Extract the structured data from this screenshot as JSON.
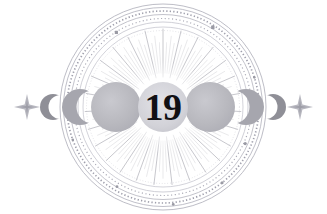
{
  "artwork": {
    "title": "Celestial Moon Phase Emblem",
    "type": "decorative-illustration",
    "canvas": {
      "width": 327,
      "height": 214,
      "background": "#ffffff"
    },
    "center_label": "19",
    "center_label_role": "day-number",
    "style": "vintage engraved astronomy / lunar calendar medallion"
  },
  "palette": {
    "background": "#ffffff",
    "ink_dark": "#111014",
    "moon_fill": "#b6b6bc",
    "moon_fill_light": "#c4c4ca",
    "crescent_fill": "#8f8f97",
    "ring_line": "#a8a8b2",
    "ring_line_faint": "#c6c6ce",
    "ray_line": "#b0b0b8",
    "marker_dot": "#9a9aa4",
    "sparkle": "#b9b9c1",
    "center_disc": "#d6d6dc"
  },
  "composition": {
    "center_x": 163,
    "center_y": 107,
    "outer_radius": 103,
    "ray_inner_radius": 30,
    "ray_outer_radius": 78,
    "ray_count": 108
  },
  "rings": [
    {
      "name": "outer-ring-1",
      "rx": 103,
      "ry": 103,
      "stroke": "#b6b6c0",
      "width": 0.9,
      "dash": "none"
    },
    {
      "name": "outer-ring-2",
      "rx": 99.5,
      "ry": 99.5,
      "stroke": "#b0b0bb",
      "width": 0.8,
      "dash": "none"
    },
    {
      "name": "tick-ring-outer",
      "rx": 96,
      "ry": 96,
      "stroke": "#a4a4b0",
      "width": 1.6,
      "dash": "1.4 2.2"
    },
    {
      "name": "outer-ring-3",
      "rx": 92.5,
      "ry": 92.5,
      "stroke": "#b4b4be",
      "width": 0.8,
      "dash": "none"
    },
    {
      "name": "tick-ring-mid",
      "rx": 88.5,
      "ry": 88.5,
      "stroke": "#aaaab6",
      "width": 1.2,
      "dash": "1.2 2.6"
    },
    {
      "name": "outer-ring-4",
      "rx": 85,
      "ry": 85,
      "stroke": "#bcbcc6",
      "width": 0.7,
      "dash": "none"
    },
    {
      "name": "inner-ring-1",
      "rx": 80,
      "ry": 80,
      "stroke": "#c0c0ca",
      "width": 0.7,
      "dash": "none"
    },
    {
      "name": "inner-ring-2",
      "rx": 76.5,
      "ry": 76.5,
      "stroke": "#c6c6ce",
      "width": 0.6,
      "dash": "0.8 2.0"
    }
  ],
  "ring_markers": [
    {
      "name": "marker-dot-ne",
      "angle_deg": -58,
      "radius": 94,
      "size": 3.4,
      "shape": "square"
    },
    {
      "name": "marker-dot-nw",
      "angle_deg": -122,
      "radius": 88,
      "size": 3.2,
      "shape": "square"
    },
    {
      "name": "marker-dot-e-upper",
      "angle_deg": -18,
      "radius": 96,
      "size": 2.6,
      "shape": "circle"
    },
    {
      "name": "marker-dot-e-lower",
      "angle_deg": 24,
      "radius": 90,
      "size": 3.2,
      "shape": "circle"
    },
    {
      "name": "marker-dot-se",
      "angle_deg": 52,
      "radius": 96,
      "size": 3.0,
      "shape": "circle"
    },
    {
      "name": "marker-dot-s",
      "angle_deg": 84,
      "radius": 98,
      "size": 2.8,
      "shape": "circle"
    },
    {
      "name": "marker-dot-sw",
      "angle_deg": 120,
      "radius": 92,
      "size": 2.8,
      "shape": "circle"
    },
    {
      "name": "marker-dot-w",
      "angle_deg": 160,
      "radius": 96,
      "size": 2.6,
      "shape": "circle"
    }
  ],
  "moon_phases": [
    {
      "name": "sparkle-left",
      "label": "four-point star",
      "icon": "sparkle-icon",
      "cx": 27,
      "cy": 107,
      "size": 13,
      "kind": "sparkle"
    },
    {
      "name": "crescent-waning-outer-left",
      "label": "Waning Crescent",
      "icon": "moon-crescent-icon",
      "cx": 53,
      "cy": 107,
      "r": 13,
      "kind": "crescent",
      "facing": "right"
    },
    {
      "name": "crescent-thick-left",
      "label": "Waning Gibbous Edge",
      "icon": "moon-gibbous-icon",
      "cx": 80,
      "cy": 107,
      "r": 18,
      "kind": "crescent-thick",
      "facing": "right"
    },
    {
      "name": "moon-disc-left",
      "label": "Full Moon Left",
      "icon": "moon-full-icon",
      "cx": 116,
      "cy": 107,
      "r": 25,
      "kind": "disc"
    },
    {
      "name": "center-disc",
      "label": "Day Marker",
      "icon": "day-number-disc",
      "cx": 163,
      "cy": 107,
      "r": 25,
      "kind": "center"
    },
    {
      "name": "moon-disc-right",
      "label": "Full Moon Right",
      "icon": "moon-full-icon",
      "cx": 210,
      "cy": 107,
      "r": 25,
      "kind": "disc"
    },
    {
      "name": "crescent-thick-right",
      "label": "Waxing Gibbous Edge",
      "icon": "moon-gibbous-icon",
      "cx": 246,
      "cy": 107,
      "r": 18,
      "kind": "crescent-thick",
      "facing": "left"
    },
    {
      "name": "crescent-waxing-outer-right",
      "label": "Waxing Crescent",
      "icon": "moon-crescent-icon",
      "cx": 273,
      "cy": 107,
      "r": 13,
      "kind": "crescent",
      "facing": "left"
    },
    {
      "name": "sparkle-right",
      "label": "four-point star",
      "icon": "sparkle-icon",
      "cx": 300,
      "cy": 107,
      "size": 13,
      "kind": "sparkle"
    }
  ]
}
